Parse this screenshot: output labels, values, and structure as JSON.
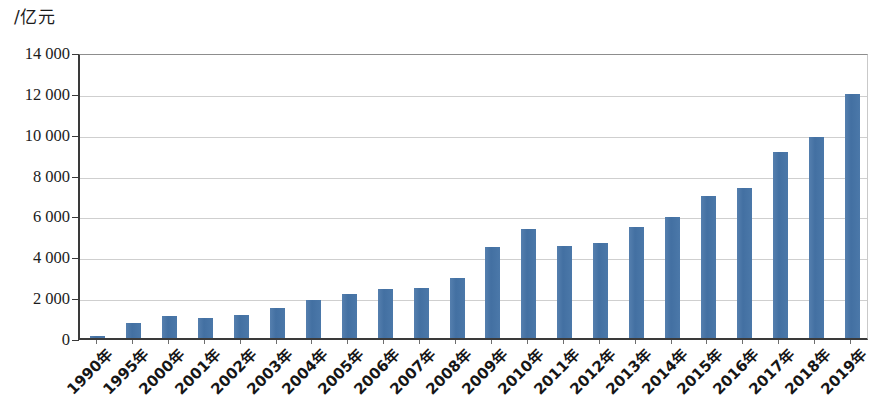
{
  "chart_data": {
    "type": "bar",
    "title": "",
    "subtitle": "",
    "unit_label": "/亿元",
    "xlabel": "",
    "ylabel": "",
    "ylim": [
      0,
      14000
    ],
    "ytick_labels": [
      "14 000",
      "12 000",
      "10 000",
      "8 000",
      "6 000",
      "4 000",
      "2 000",
      "0"
    ],
    "ytick_values": [
      14000,
      12000,
      10000,
      8000,
      6000,
      4000,
      2000,
      0
    ],
    "grid": true,
    "legend": "none",
    "categories": [
      "1990年",
      "1995年",
      "2000年",
      "2001年",
      "2002年",
      "2003年",
      "2004年",
      "2005年",
      "2006年",
      "2007年",
      "2008年",
      "2009年",
      "2010年",
      "2011年",
      "2012年",
      "2013年",
      "2014年",
      "2015年",
      "2016年",
      "2017年",
      "2018年",
      "2019年"
    ],
    "values": [
      100,
      730,
      1070,
      980,
      1150,
      1450,
      1870,
      2160,
      2400,
      2440,
      2930,
      4450,
      5320,
      4500,
      4660,
      5450,
      5900,
      6950,
      7320,
      9130,
      9830,
      11930
    ],
    "series": [
      {
        "name": "",
        "color": "#4a78ab",
        "values": [
          100,
          730,
          1070,
          980,
          1150,
          1450,
          1870,
          2160,
          2400,
          2440,
          2930,
          4450,
          5320,
          4500,
          4660,
          5450,
          5900,
          6950,
          7320,
          9130,
          9830,
          11930
        ]
      }
    ],
    "colors": {
      "bar": "#4a78ab",
      "gridline": "#cfcfcf",
      "axis": "#3a3a3a",
      "text": "#1b1b1b",
      "background": "#ffffff"
    }
  }
}
